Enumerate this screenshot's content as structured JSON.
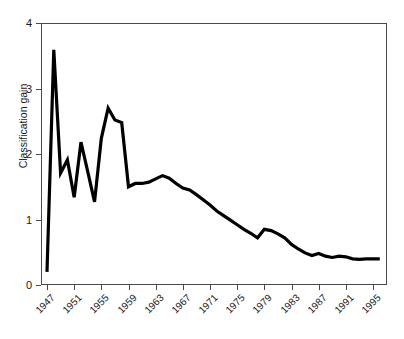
{
  "chart_data": {
    "type": "line",
    "title": "",
    "xlabel": "",
    "ylabel": "Classification gain",
    "xlim": [
      1947,
      1996
    ],
    "ylim": [
      0,
      4
    ],
    "grid": false,
    "legend": null,
    "x_tick_labels": [
      "1947",
      "1951",
      "1955",
      "1959",
      "1963",
      "1967",
      "1971",
      "1975",
      "1979",
      "1983",
      "1987",
      "1991",
      "1995"
    ],
    "x_tick_values": [
      1947,
      1951,
      1955,
      1959,
      1963,
      1967,
      1971,
      1975,
      1979,
      1983,
      1987,
      1991,
      1995
    ],
    "y_tick_labels": [
      "0",
      "1",
      "2",
      "3",
      "4"
    ],
    "y_tick_values": [
      0,
      1,
      2,
      3,
      4
    ],
    "series": [
      {
        "name": "Classification gain",
        "color": "#000000",
        "x": [
          1947,
          1948,
          1949,
          1950,
          1951,
          1952,
          1953,
          1954,
          1955,
          1956,
          1957,
          1958,
          1959,
          1960,
          1961,
          1962,
          1963,
          1964,
          1965,
          1966,
          1967,
          1968,
          1969,
          1970,
          1971,
          1972,
          1973,
          1974,
          1975,
          1976,
          1977,
          1978,
          1979,
          1980,
          1981,
          1982,
          1983,
          1984,
          1985,
          1986,
          1987,
          1988,
          1989,
          1990,
          1991,
          1992,
          1993,
          1994,
          1995,
          1996
        ],
        "y": [
          0.2,
          3.59,
          1.71,
          1.91,
          1.34,
          2.18,
          1.73,
          1.27,
          2.24,
          2.7,
          2.52,
          2.48,
          1.5,
          1.55,
          1.55,
          1.57,
          1.62,
          1.67,
          1.63,
          1.55,
          1.48,
          1.45,
          1.38,
          1.3,
          1.22,
          1.13,
          1.06,
          0.99,
          0.92,
          0.85,
          0.79,
          0.72,
          0.85,
          0.83,
          0.78,
          0.72,
          0.62,
          0.55,
          0.49,
          0.45,
          0.48,
          0.44,
          0.42,
          0.44,
          0.43,
          0.4,
          0.39,
          0.4,
          0.4,
          0.4
        ]
      }
    ]
  },
  "axis": {
    "y_label": "Classification gain"
  }
}
